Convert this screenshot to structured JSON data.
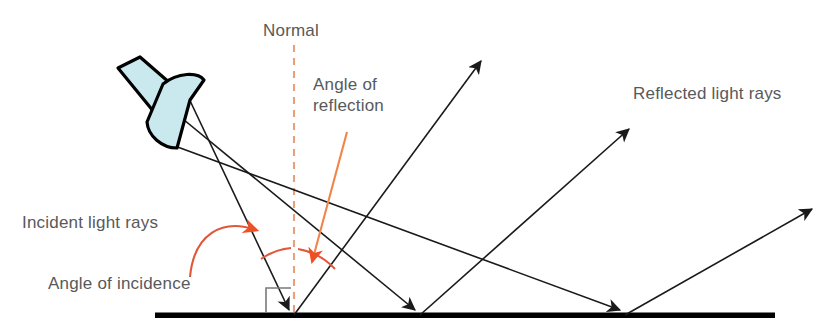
{
  "diagram": {
    "labels": {
      "normal": "Normal",
      "angle_of_reflection_line1": "Angle of",
      "angle_of_reflection_line2": "reflection",
      "reflected_light_rays": "Reflected light rays",
      "incident_light_rays": "Incident light rays",
      "angle_of_incidence": "Angle of incidence"
    },
    "colors": {
      "text": "#58595b",
      "ray": "#1a1a1a",
      "surface": "#000000",
      "normal_dashed": "#e8a07a",
      "annotation_orange": "#f04e23",
      "annotation_arc": "#e0583a",
      "torch_fill": "#c9e9ef",
      "torch_outline": "#000000",
      "right_angle_marker": "#7a7a7a",
      "background": "#ffffff"
    },
    "geometry": {
      "surface_y": 315,
      "surface_x_start": 155,
      "surface_x_end": 775,
      "normal_x": 294,
      "normal_y_top": 45,
      "normal_y_bottom": 315,
      "incidence_points": [
        294,
        420,
        625
      ],
      "torch_origin": [
        170,
        118
      ]
    },
    "elements": {
      "incident_ray_count": 3,
      "reflected_ray_count": 3,
      "normal_style": "dashed",
      "right_angle_marker": true
    }
  }
}
